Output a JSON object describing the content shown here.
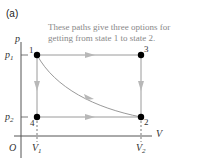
{
  "panel_label": "(a)",
  "caption": {
    "line1": "These paths give three options for",
    "line2": "getting from state 1 to state 2."
  },
  "axes": {
    "y_label": "p",
    "x_label": "V",
    "origin": "O",
    "y_ticks": [
      {
        "label": "p",
        "sub": "1"
      },
      {
        "label": "p",
        "sub": "2"
      }
    ],
    "x_ticks": [
      {
        "label": "V",
        "sub": "1"
      },
      {
        "label": "V",
        "sub": "2"
      }
    ]
  },
  "states": [
    {
      "id": "1",
      "label": "1"
    },
    {
      "id": "2",
      "label": "2"
    },
    {
      "id": "3",
      "label": "3"
    },
    {
      "id": "4",
      "label": "4"
    }
  ],
  "colors": {
    "path": "#9a9a9a",
    "arrow": "#b8b8b8",
    "axis": "#555555",
    "point": "#000000",
    "caption": "#888888"
  },
  "paths": [
    {
      "name": "1-3-2",
      "segments": [
        "1→3",
        "3→2"
      ]
    },
    {
      "name": "1-4-2",
      "segments": [
        "1→4",
        "4→2"
      ]
    },
    {
      "name": "1-2 curve",
      "segments": [
        "1→2"
      ]
    }
  ]
}
